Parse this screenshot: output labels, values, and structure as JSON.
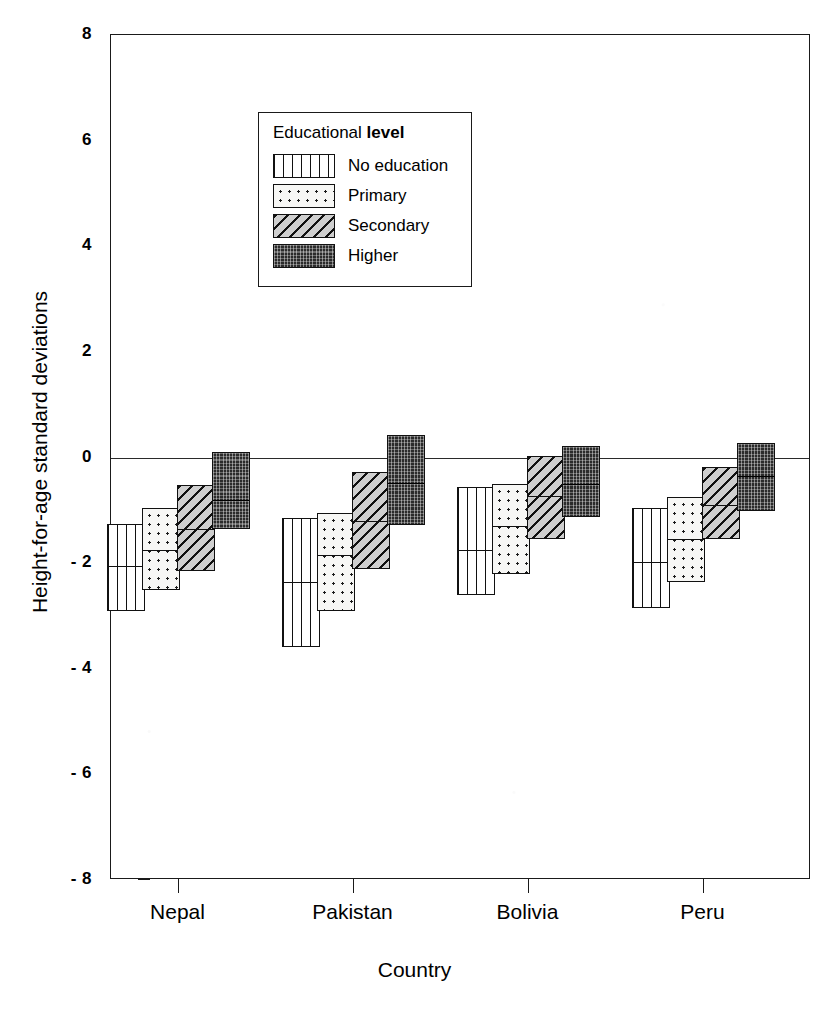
{
  "chart_data": {
    "type": "box",
    "title": "",
    "xlabel": "Country",
    "ylabel": "Height-for-age standard deviations",
    "categories": [
      "Nepal",
      "Pakistan",
      "Bolivia",
      "Peru"
    ],
    "ylim": [
      -8,
      8
    ],
    "yticks": [
      8,
      6,
      4,
      2,
      0,
      -2,
      -4,
      -6,
      -8
    ],
    "ytick_labels": [
      "8",
      "6",
      "4",
      "2",
      "0",
      "- 2",
      "- 4",
      "- 6",
      "- 8"
    ],
    "grid": false,
    "zero_reference_line": 0,
    "legend": {
      "title_plain": "Educational ",
      "title_strong": "level",
      "position": "inside-upper-left",
      "entries": [
        {
          "label": "No education",
          "pattern": "vertical-lines"
        },
        {
          "label": "Primary",
          "pattern": "dots"
        },
        {
          "label": "Secondary",
          "pattern": "diagonal-hatch"
        },
        {
          "label": "Higher",
          "pattern": "solid-dark-texture"
        }
      ]
    },
    "series": [
      {
        "name": "No education",
        "pattern": "vertical-lines",
        "boxes": [
          {
            "category": "Nepal",
            "upper": -1.25,
            "median": -2.05,
            "lower": -2.9
          },
          {
            "category": "Pakistan",
            "upper": -1.15,
            "median": -2.35,
            "lower": -3.58
          },
          {
            "category": "Bolivia",
            "upper": -0.55,
            "median": -1.75,
            "lower": -2.6
          },
          {
            "category": "Peru",
            "upper": -0.95,
            "median": -1.98,
            "lower": -2.85
          }
        ]
      },
      {
        "name": "Primary",
        "pattern": "dots",
        "boxes": [
          {
            "category": "Nepal",
            "upper": -0.95,
            "median": -1.75,
            "lower": -2.5
          },
          {
            "category": "Pakistan",
            "upper": -1.05,
            "median": -1.85,
            "lower": -2.9
          },
          {
            "category": "Bolivia",
            "upper": -0.5,
            "median": -1.3,
            "lower": -2.2
          },
          {
            "category": "Peru",
            "upper": -0.75,
            "median": -1.55,
            "lower": -2.35
          }
        ]
      },
      {
        "name": "Secondary",
        "pattern": "diagonal-hatch",
        "boxes": [
          {
            "category": "Nepal",
            "upper": -0.52,
            "median": -1.35,
            "lower": -2.15
          },
          {
            "category": "Pakistan",
            "upper": -0.28,
            "median": -1.2,
            "lower": -2.12
          },
          {
            "category": "Bolivia",
            "upper": 0.02,
            "median": -0.72,
            "lower": -1.55
          },
          {
            "category": "Peru",
            "upper": -0.18,
            "median": -0.9,
            "lower": -1.55
          }
        ]
      },
      {
        "name": "Higher",
        "pattern": "solid-dark-texture",
        "boxes": [
          {
            "category": "Nepal",
            "upper": 0.1,
            "median": -0.8,
            "lower": -1.35
          },
          {
            "category": "Pakistan",
            "upper": 0.42,
            "median": -0.48,
            "lower": -1.28
          },
          {
            "category": "Bolivia",
            "upper": 0.22,
            "median": -0.5,
            "lower": -1.12
          },
          {
            "category": "Peru",
            "upper": 0.28,
            "median": -0.35,
            "lower": -1.02
          }
        ]
      }
    ]
  }
}
